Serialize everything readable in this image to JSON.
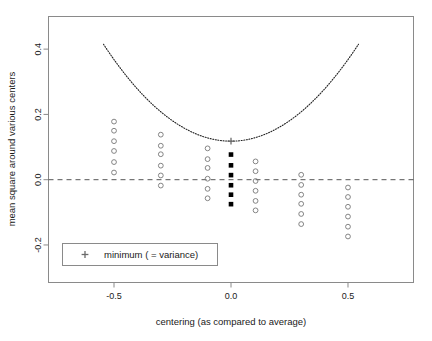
{
  "chart_data": {
    "type": "scatter",
    "title": "",
    "xlabel": "centering (as compared to average)",
    "ylabel": "mean square around various centers",
    "xlim": [
      -0.78,
      0.78
    ],
    "ylim": [
      -0.315,
      0.5
    ],
    "xticks": [
      -0.5,
      0.0,
      0.5
    ],
    "xtick_labels": [
      "-0.5",
      "0.0",
      "0.5"
    ],
    "yticks": [
      -0.2,
      0.0,
      0.2,
      0.4
    ],
    "ytick_labels": [
      "-0.2",
      "0.0",
      "0.2",
      "0.4"
    ],
    "grid": false,
    "legend_position": "bottom-left",
    "hline": {
      "y": 0.0,
      "style": "dashed",
      "color": "#555555"
    },
    "curve": {
      "name": "mean square about center c",
      "style": "dotted",
      "color": "#222222",
      "type": "parabola",
      "vertex": [
        0.0,
        0.118
      ],
      "coefficient": 1.0,
      "x_range": [
        -0.545,
        0.545
      ]
    },
    "minimum_marker": {
      "label": "minimum ( = variance)",
      "symbol": "+",
      "x": 0.0,
      "y": 0.118
    },
    "series": [
      {
        "name": "c = -0.5",
        "marker": "open-circle",
        "color": "#777777",
        "x": -0.5,
        "values": [
          0.178,
          0.15,
          0.118,
          0.088,
          0.054,
          0.022
        ]
      },
      {
        "name": "c = -0.3",
        "marker": "open-circle",
        "color": "#777777",
        "x": -0.3,
        "values": [
          0.138,
          0.104,
          0.078,
          0.043,
          0.013,
          -0.018
        ]
      },
      {
        "name": "c = -0.1",
        "marker": "open-circle",
        "color": "#777777",
        "x": -0.1,
        "values": [
          0.096,
          0.063,
          0.036,
          0.003,
          -0.028,
          -0.057
        ]
      },
      {
        "name": "c = 0.0",
        "marker": "filled-square",
        "color": "#000000",
        "x": 0.0,
        "values": [
          0.077,
          0.044,
          0.014,
          -0.017,
          -0.046,
          -0.075
        ]
      },
      {
        "name": "c = 0.1",
        "marker": "open-circle",
        "color": "#777777",
        "x": 0.105,
        "values": [
          0.056,
          0.026,
          -0.004,
          -0.034,
          -0.065,
          -0.094
        ]
      },
      {
        "name": "c = 0.3",
        "marker": "open-circle",
        "color": "#777777",
        "x": 0.3,
        "values": [
          0.015,
          -0.016,
          -0.046,
          -0.074,
          -0.105,
          -0.136
        ]
      },
      {
        "name": "c = 0.5",
        "marker": "open-circle",
        "color": "#777777",
        "x": 0.5,
        "values": [
          -0.024,
          -0.053,
          -0.083,
          -0.113,
          -0.144,
          -0.174
        ]
      }
    ]
  },
  "legend": {
    "entries": [
      {
        "symbol": "+",
        "label": "minimum ( = variance)"
      }
    ]
  },
  "axes": {
    "x_title": "centering (as compared to average)",
    "y_title": "mean square around various centers"
  },
  "colors": {
    "frame": "#8a8a8a",
    "point_open": "#808080",
    "point_filled": "#000000",
    "curve": "#2a2a2a",
    "hline": "#555555",
    "text": "#1a1a1a",
    "background": "#ffffff"
  }
}
